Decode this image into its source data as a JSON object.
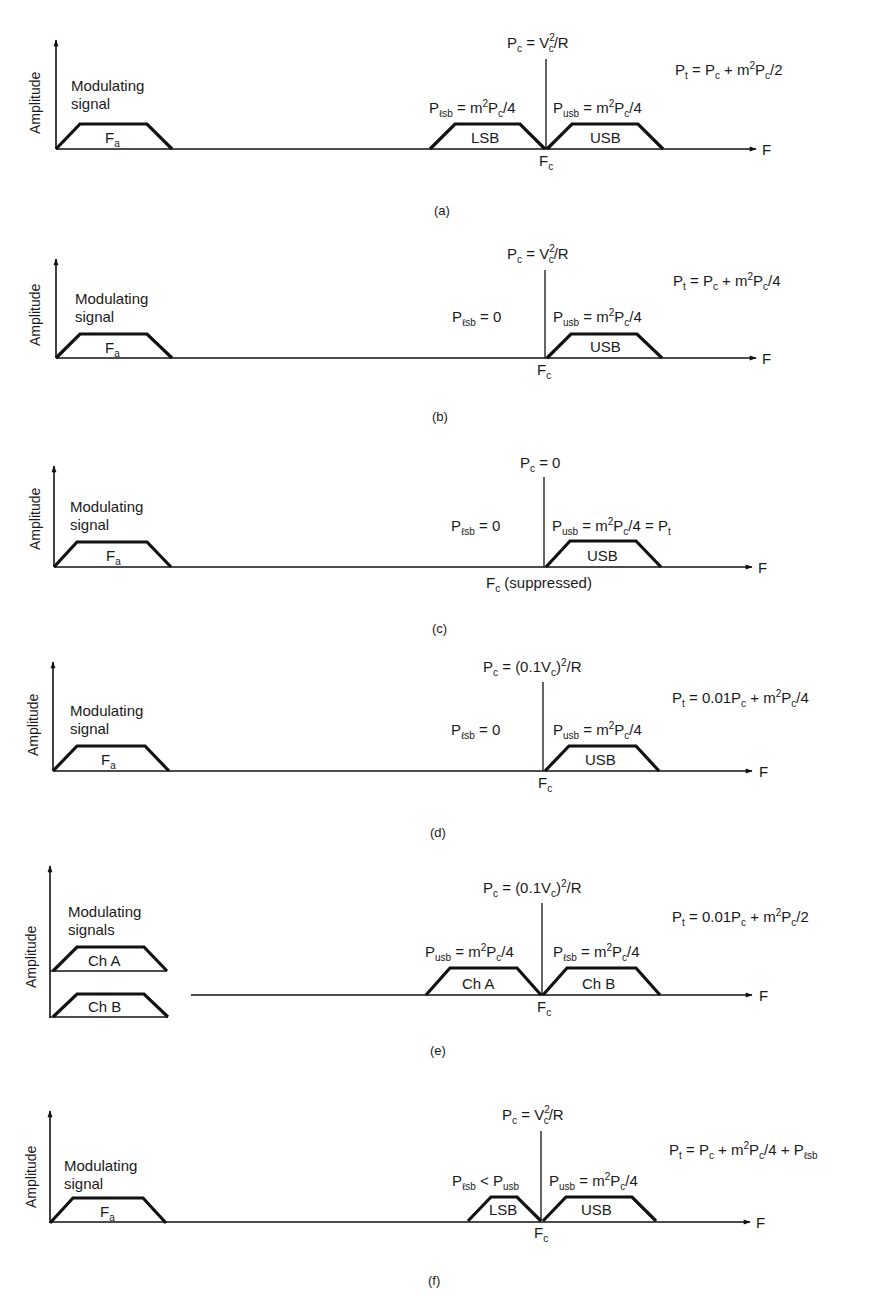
{
  "figure": {
    "panels": [
      {
        "id": "a",
        "caption": "(a)",
        "y_axis_label": "Amplitude",
        "x_axis_label": "F",
        "modulating_label_line1": "Modulating",
        "modulating_label_line2": "signal",
        "baseband_label": "F",
        "baseband_sub": "a",
        "carrier_label": {
          "main": "P",
          "sub": "c",
          "rest": " = V",
          "sup": "2",
          "sub2": "c",
          "tail": "/R"
        },
        "carrier_freq": {
          "main": "F",
          "sub": "c",
          "tail": ""
        },
        "left_band_label": "LSB",
        "right_band_label": "USB",
        "left_power": "P_lsb = m²P_c/4",
        "right_power": "P_usb = m²P_c/4",
        "total_power": "P_t = P_c + m²P_c/2"
      },
      {
        "id": "b",
        "caption": "(b)",
        "y_axis_label": "Amplitude",
        "x_axis_label": "F",
        "modulating_label_line1": "Modulating",
        "modulating_label_line2": "signal",
        "baseband_label": "F",
        "baseband_sub": "a",
        "carrier_label": "P_c = V_c²/R",
        "carrier_freq": "F_c",
        "right_band_label": "USB",
        "left_power": "P_lsb = 0",
        "right_power": "P_usb = m²P_c/4",
        "total_power": "P_t = P_c + m²P_c/4"
      },
      {
        "id": "c",
        "caption": "(c)",
        "y_axis_label": "Amplitude",
        "x_axis_label": "F",
        "modulating_label_line1": "Modulating",
        "modulating_label_line2": "signal",
        "baseband_label": "F",
        "baseband_sub": "a",
        "carrier_label": "P_c = 0",
        "carrier_freq": "F_c (suppressed)",
        "carrier_freq_note": "(suppressed)",
        "right_band_label": "USB",
        "left_power": "P_lsb = 0",
        "right_power": "P_usb = m²P_c/4 = P_t"
      },
      {
        "id": "d",
        "caption": "(d)",
        "y_axis_label": "Amplitude",
        "x_axis_label": "F",
        "modulating_label_line1": "Modulating",
        "modulating_label_line2": "signal",
        "baseband_label": "F",
        "baseband_sub": "a",
        "carrier_label": "P_c = (0.1V_c)²/R",
        "carrier_freq": "F_c",
        "right_band_label": "USB",
        "left_power": "P_lsb = 0",
        "right_power": "P_usb = m²P_c/4",
        "total_power": "P_t = 0.01P_c + m²P_c/4"
      },
      {
        "id": "e",
        "caption": "(e)",
        "y_axis_label": "Amplitude",
        "x_axis_label": "F",
        "modulating_label_line1": "Modulating",
        "modulating_label_line2": "signals",
        "channel_a_label": "Ch A",
        "channel_b_label": "Ch B",
        "carrier_label": "P_c = (0.1V_c)²/R",
        "carrier_freq": "F_c",
        "left_band_label": "Ch A",
        "right_band_label": "Ch B",
        "left_power": "P_usb = m²P_c/4",
        "right_power": "P_lsb = m²P_c/4",
        "total_power": "P_t = 0.01P_c + m²P_c/2"
      },
      {
        "id": "f",
        "caption": "(f)",
        "y_axis_label": "Amplitude",
        "x_axis_label": "F",
        "modulating_label_line1": "Modulating",
        "modulating_label_line2": "signal",
        "baseband_label": "F",
        "baseband_sub": "a",
        "carrier_label": "P_c = V_c²/R",
        "carrier_freq": "F_c",
        "left_band_label": "LSB",
        "right_band_label": "USB",
        "left_power": "P_lsb < P_usb",
        "right_power": "P_usb = m²P_c/4",
        "total_power": "P_t = P_c + m²P_c/4 + P_lsb"
      }
    ],
    "text": {
      "amplitude": "Amplitude",
      "F": "F",
      "P": "P",
      "m": "m",
      "c": "c",
      "t": "t",
      "a": "a",
      "usb": "usb",
      "lsb": "ℓsb",
      "two": "2",
      "modulating": "Modulating",
      "signal": "signal",
      "signals": "signals",
      "LSB": "LSB",
      "USB": "USB",
      "ChA": "Ch A",
      "ChB": "Ch B",
      "eq": " = ",
      "eq0": " = 0",
      "lt": " < ",
      "plus": " + ",
      "V": "V",
      "slashR": "/R",
      "slash4": "/4",
      "slash2": "/2",
      "open01V": "(0.1V",
      "close": ")",
      "p01": "0.01P",
      "suppressed": " (suppressed)",
      "eqPt": " = P",
      "cap_a": "(a)",
      "cap_b": "(b)",
      "cap_c": "(c)",
      "cap_d": "(d)",
      "cap_e": "(e)",
      "cap_f": "(f)"
    }
  }
}
